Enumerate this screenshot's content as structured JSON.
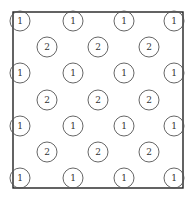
{
  "diagram": {
    "frame": {
      "x": 13,
      "y": 12,
      "width": 170,
      "height": 176,
      "stroke": "#222222"
    },
    "circle_radius": 10,
    "circle_stroke": "#555555",
    "nodes": [
      {
        "label": "1",
        "x": 20,
        "y": 21
      },
      {
        "label": "1",
        "x": 73,
        "y": 21
      },
      {
        "label": "1",
        "x": 124,
        "y": 21
      },
      {
        "label": "1",
        "x": 174,
        "y": 21
      },
      {
        "label": "2",
        "x": 47,
        "y": 47
      },
      {
        "label": "2",
        "x": 98,
        "y": 47
      },
      {
        "label": "2",
        "x": 149,
        "y": 47
      },
      {
        "label": "1",
        "x": 20,
        "y": 73
      },
      {
        "label": "1",
        "x": 73,
        "y": 73
      },
      {
        "label": "1",
        "x": 124,
        "y": 73
      },
      {
        "label": "1",
        "x": 174,
        "y": 73
      },
      {
        "label": "2",
        "x": 47,
        "y": 100
      },
      {
        "label": "2",
        "x": 98,
        "y": 100
      },
      {
        "label": "2",
        "x": 149,
        "y": 100
      },
      {
        "label": "1",
        "x": 20,
        "y": 126
      },
      {
        "label": "1",
        "x": 73,
        "y": 126
      },
      {
        "label": "1",
        "x": 124,
        "y": 126
      },
      {
        "label": "1",
        "x": 174,
        "y": 126
      },
      {
        "label": "2",
        "x": 47,
        "y": 152
      },
      {
        "label": "2",
        "x": 98,
        "y": 152
      },
      {
        "label": "2",
        "x": 149,
        "y": 152
      },
      {
        "label": "1",
        "x": 20,
        "y": 178
      },
      {
        "label": "1",
        "x": 73,
        "y": 178
      },
      {
        "label": "1",
        "x": 124,
        "y": 178
      },
      {
        "label": "1",
        "x": 174,
        "y": 178
      }
    ]
  }
}
